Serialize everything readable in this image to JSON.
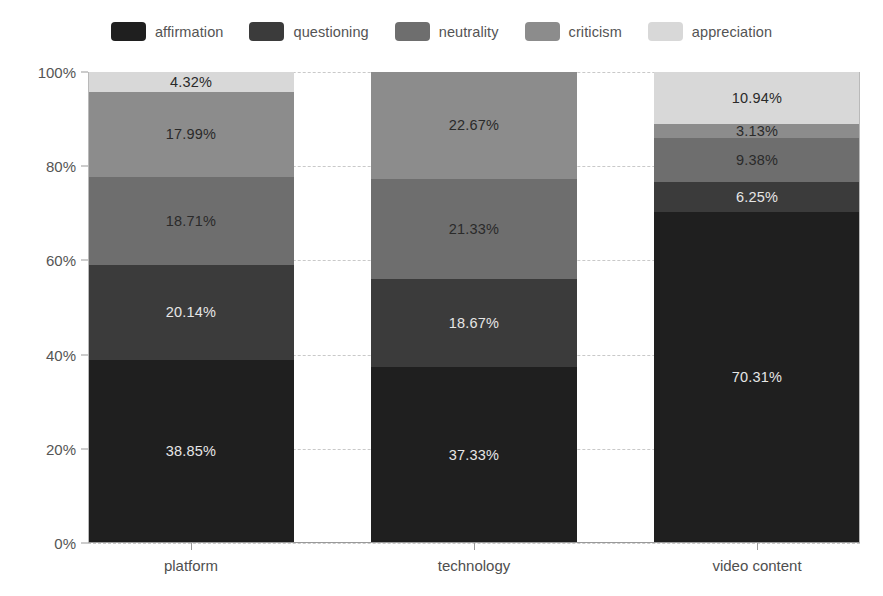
{
  "chart_data": {
    "type": "bar",
    "variant": "stacked-100-percent",
    "orientation": "vertical",
    "title": "",
    "subtitle": "",
    "xlabel": "",
    "ylabel": "",
    "categories": [
      "platform",
      "technology",
      "video content"
    ],
    "series": [
      {
        "name": "affirmation",
        "color": "#1f1f1f",
        "values": [
          38.85,
          37.33,
          70.31
        ],
        "labels": [
          "38.85%",
          "37.33%",
          "70.31%"
        ],
        "label_color": "light"
      },
      {
        "name": "questioning",
        "color": "#3b3b3b",
        "values": [
          20.14,
          18.67,
          6.25
        ],
        "labels": [
          "20.14%",
          "18.67%",
          "6.25%"
        ],
        "label_color": "light"
      },
      {
        "name": "neutrality",
        "color": "#6e6e6e",
        "values": [
          18.71,
          21.33,
          9.38
        ],
        "labels": [
          "18.71%",
          "21.33%",
          "9.38%"
        ],
        "label_color": "dark"
      },
      {
        "name": "criticism",
        "color": "#8c8c8c",
        "values": [
          17.99,
          22.67,
          3.13
        ],
        "labels": [
          "17.99%",
          "22.67%",
          "3.13%"
        ],
        "label_color": "dark"
      },
      {
        "name": "appreciation",
        "color": "#d8d8d8",
        "values": [
          4.32,
          0,
          10.94
        ],
        "labels": [
          "4.32%",
          "",
          "10.94%"
        ],
        "label_color": "dark"
      }
    ],
    "ylim": [
      0,
      100
    ],
    "yticks": [
      0,
      20,
      40,
      60,
      80,
      100
    ],
    "ytick_labels": [
      "0%",
      "20%",
      "40%",
      "60%",
      "80%",
      "100%"
    ],
    "grid": true,
    "grid_style": "dashed-horizontal",
    "legend_position": "top-center",
    "legend_entries": [
      "affirmation",
      "questioning",
      "neutrality",
      "criticism",
      "appreciation"
    ]
  },
  "colors": {
    "background": "#ffffff",
    "axis": "#9a9a9a",
    "grid": "#c9c9c9",
    "tick_text": "#555555",
    "legend_text": "#545454"
  }
}
